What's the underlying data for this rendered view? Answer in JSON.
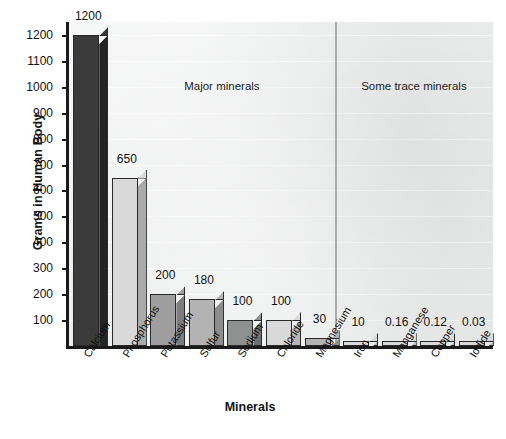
{
  "chart_data": {
    "type": "bar",
    "title": "",
    "xlabel": "Minerals",
    "ylabel": "Grams in Human Body",
    "ylim": [
      0,
      1250
    ],
    "grid": true,
    "legend_position": "none",
    "categories": [
      "Calcium",
      "Phosphorus",
      "Potassium",
      "Sulfur",
      "Sodium",
      "Chloride",
      "Magnesium",
      "Iron",
      "Manganese",
      "Copper",
      "Iodide"
    ],
    "values": [
      1200,
      650,
      200,
      180,
      100,
      100,
      30,
      10,
      0.16,
      0.12,
      0.03
    ],
    "value_labels": [
      "1200",
      "650",
      "200",
      "180",
      "100",
      "100",
      "30",
      "10",
      "0.16",
      "0.12",
      "0.03"
    ],
    "bar_colors": [
      "#3b3b3b",
      "#d8d9d8",
      "#9d9e9d",
      "#b2b3b2",
      "#8f9090",
      "#d8d9d8",
      "#b2b3b2",
      "#d8d9d8",
      "#d8d9d8",
      "#d8d9d8",
      "#d8d9d8"
    ],
    "bar_side_colors": [
      "#242424",
      "#a9aaa9",
      "#7c7d7c",
      "#8c8d8c",
      "#6f7070",
      "#b5b6b5",
      "#8c8d8c",
      "#b5b6b5",
      "#b5b6b5",
      "#b5b6b5",
      "#b5b6b5"
    ],
    "ytick_labels": [
      "1200",
      "1100",
      "1000",
      "900",
      "800",
      "700",
      "600",
      "500",
      "400",
      "300",
      "200",
      "100"
    ],
    "ytick_values": [
      1200,
      1100,
      1000,
      900,
      800,
      700,
      600,
      500,
      400,
      300,
      200,
      100
    ],
    "annotations": [
      {
        "text": "Major minerals",
        "position": "left-section"
      },
      {
        "text": "Some trace minerals",
        "position": "right-section"
      }
    ],
    "section_divider_after_category": "Magnesium",
    "plot_background": "#eceded",
    "axis_color": "#1a1a1a"
  }
}
